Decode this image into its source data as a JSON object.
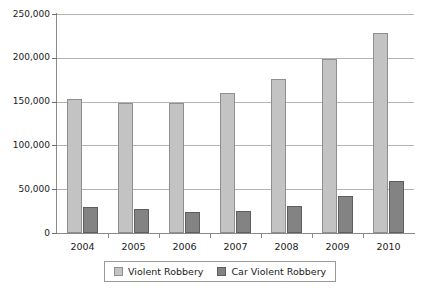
{
  "chart_data": {
    "type": "bar",
    "title": "",
    "subtitle": "",
    "xlabel": "",
    "ylabel": "",
    "categories": [
      "2004",
      "2005",
      "2006",
      "2007",
      "2008",
      "2009",
      "2010"
    ],
    "series": [
      {
        "name": "Violent Robbery",
        "color": "#c3c3c3",
        "values": [
          153000,
          148000,
          148000,
          160000,
          176000,
          199000,
          228000
        ]
      },
      {
        "name": "Car Violent Robbery",
        "color": "#838383",
        "values": [
          30000,
          27000,
          24000,
          25000,
          31000,
          42000,
          59000
        ]
      }
    ],
    "ylim": [
      0,
      250000
    ],
    "ytick_step": 50000,
    "ytick_labels": [
      "0",
      "50,000",
      "100,000",
      "150,000",
      "200,000",
      "250,000"
    ],
    "ytick_values": [
      0,
      50000,
      100000,
      150000,
      200000,
      250000
    ],
    "grid": true,
    "legend_position": "bottom"
  }
}
